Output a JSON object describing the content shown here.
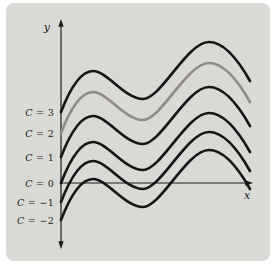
{
  "figure": {
    "panel_bg": "#d9d9d6",
    "page_bg": "#ffffff",
    "axis_color": "#1c1c1c",
    "curve_color": "#161616",
    "highlight_color": "#908a88",
    "label_color": "#1b1b1b"
  },
  "chart_data": {
    "type": "line",
    "xlabel": "x",
    "ylabel": "y",
    "grid": false,
    "axes": {
      "x_axis": "horizontal arrow to the right through the C = 0 intercept",
      "y_axis": "vertical double-headed arrow"
    },
    "legend_position": "labels in left margin, each aligned with its curve's y-intercept",
    "series": [
      {
        "name": "C = 3",
        "C": 3,
        "highlighted": false,
        "y_intercept_px": 112
      },
      {
        "name": "C = 2",
        "C": 2,
        "highlighted": true,
        "y_intercept_px": 133
      },
      {
        "name": "C = 1",
        "C": 1,
        "highlighted": false,
        "y_intercept_px": 157
      },
      {
        "name": "C = 0",
        "C": 0,
        "highlighted": false,
        "y_intercept_px": 183
      },
      {
        "name": "C = −1",
        "C": -1,
        "highlighted": false,
        "y_intercept_px": 202
      },
      {
        "name": "C = −2",
        "C": -2,
        "highlighted": false,
        "y_intercept_px": 220
      }
    ],
    "shape": {
      "description": "Each curve starts on the y-axis at y = C, rises to a local maximum, dips to a shallow local minimum, rises to a higher maximum, then falls steeply near the right edge; curves never intersect.",
      "keypoints_rel_px": {
        "start": [
          0,
          0
        ],
        "local_max": [
          32,
          -41
        ],
        "local_min": [
          82,
          -13
        ],
        "global_max": [
          148,
          -70
        ],
        "end": [
          189,
          -31
        ]
      }
    }
  },
  "plot": {
    "origin_x_px": 61,
    "x_axis_y_px": 183,
    "x_axis_end_px": 253,
    "y_axis_top_px": 19,
    "y_axis_bottom_px": 249,
    "label_right_edge_px": 54
  }
}
